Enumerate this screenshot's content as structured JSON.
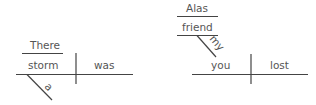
{
  "diagram": {
    "type": "sentence-diagram",
    "line_color": "#444444",
    "text_color": "#555555",
    "left": {
      "expletive": "There",
      "subject": "storm",
      "verb": "was",
      "modifier": "a"
    },
    "right": {
      "interjection": "Alas",
      "address": "friend",
      "address_modifier": "my",
      "subject": "you",
      "verb": "lost"
    }
  }
}
